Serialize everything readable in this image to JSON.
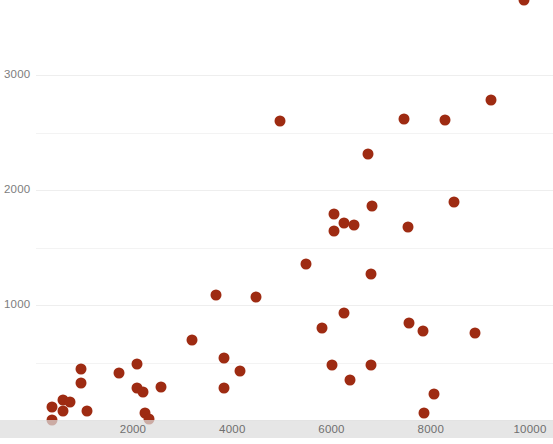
{
  "chart_data": {
    "type": "scatter",
    "title": "",
    "subtitle": "",
    "xlabel": "",
    "ylabel": "",
    "xlim": [
      0,
      10600
    ],
    "ylim": [
      0,
      3600
    ],
    "grid": true,
    "grid_axis": "y",
    "legend": false,
    "legend_position": "none",
    "marker_color": "#9e2b12",
    "marker_size": 11,
    "gridline_color": "#f1f1f1",
    "tick_label_color": "#7d7d7d",
    "axis_band_color": "#dcdcdc",
    "background_color": "#ffffff",
    "x_ticks": [
      2000,
      4000,
      6000,
      8000,
      10000
    ],
    "x_tick_labels": [
      "2000",
      "4000",
      "6000",
      "8000",
      "10000"
    ],
    "y_ticks": [
      1000,
      2000,
      3000
    ],
    "y_tick_labels": [
      "1000",
      "2000",
      "3000"
    ],
    "y_gridlines": [
      0,
      500,
      1000,
      1500,
      2000,
      2500,
      3000
    ],
    "points": [
      {
        "x": 360,
        "y": 0
      },
      {
        "x": 360,
        "y": 110
      },
      {
        "x": 590,
        "y": 170
      },
      {
        "x": 730,
        "y": 160
      },
      {
        "x": 590,
        "y": 80
      },
      {
        "x": 950,
        "y": 440
      },
      {
        "x": 950,
        "y": 320
      },
      {
        "x": 1070,
        "y": 80
      },
      {
        "x": 1720,
        "y": 410
      },
      {
        "x": 2080,
        "y": 280
      },
      {
        "x": 2200,
        "y": 240
      },
      {
        "x": 2560,
        "y": 290
      },
      {
        "x": 2240,
        "y": 60
      },
      {
        "x": 2320,
        "y": 10
      },
      {
        "x": 2080,
        "y": 490
      },
      {
        "x": 3190,
        "y": 700
      },
      {
        "x": 3680,
        "y": 1090
      },
      {
        "x": 3840,
        "y": 540
      },
      {
        "x": 3840,
        "y": 280
      },
      {
        "x": 4160,
        "y": 430
      },
      {
        "x": 4480,
        "y": 1070
      },
      {
        "x": 4970,
        "y": 2600
      },
      {
        "x": 5480,
        "y": 1360
      },
      {
        "x": 5800,
        "y": 800
      },
      {
        "x": 6000,
        "y": 480
      },
      {
        "x": 6040,
        "y": 1790
      },
      {
        "x": 6040,
        "y": 1640
      },
      {
        "x": 6260,
        "y": 1710
      },
      {
        "x": 6260,
        "y": 930
      },
      {
        "x": 6380,
        "y": 350
      },
      {
        "x": 6460,
        "y": 1700
      },
      {
        "x": 6730,
        "y": 2310
      },
      {
        "x": 6790,
        "y": 1270
      },
      {
        "x": 6790,
        "y": 480
      },
      {
        "x": 6810,
        "y": 1860
      },
      {
        "x": 7450,
        "y": 2620
      },
      {
        "x": 7540,
        "y": 1680
      },
      {
        "x": 7560,
        "y": 840
      },
      {
        "x": 7840,
        "y": 770
      },
      {
        "x": 7860,
        "y": 60
      },
      {
        "x": 8060,
        "y": 230
      },
      {
        "x": 8290,
        "y": 2610
      },
      {
        "x": 8460,
        "y": 1900
      },
      {
        "x": 8890,
        "y": 760
      },
      {
        "x": 9210,
        "y": 2780
      },
      {
        "x": 9880,
        "y": 3650
      }
    ]
  }
}
